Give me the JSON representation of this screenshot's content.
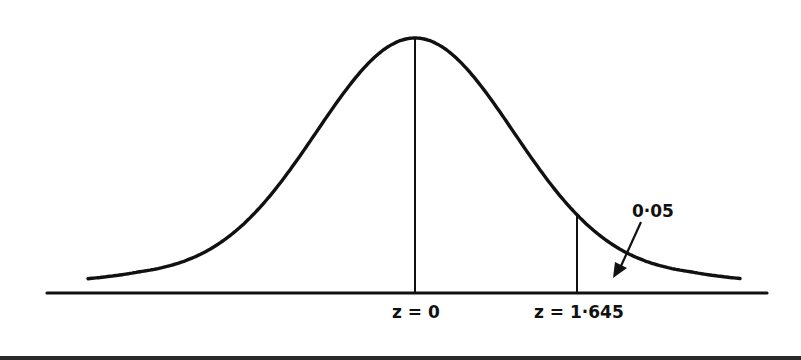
{
  "chart_data": {
    "type": "line",
    "title": "",
    "xlabel": "",
    "ylabel": "",
    "distribution": "standard normal",
    "mean": 0,
    "std": 1,
    "x_range": [
      -3.35,
      3.3
    ],
    "markers": [
      {
        "z": 0,
        "label": "z = 0",
        "type": "vertical-line-to-curve"
      },
      {
        "z": 1.645,
        "label": "z = 1·645",
        "type": "vertical-line-to-curve"
      }
    ],
    "annotations": [
      {
        "text": "0·05",
        "meaning": "shaded upper tail area beyond z = 1.645",
        "arrow": true
      }
    ],
    "grid": false,
    "legend": null
  },
  "labels": {
    "z0": "z = 0",
    "z1645": "z = 1·645",
    "tail_area": "0·05"
  },
  "geometry": {
    "center_x": 415,
    "sigma_px": 98.5,
    "curve_base_y": 276.5,
    "curve_height_px": 238.5,
    "axis_y": 293,
    "axis_x1": 47,
    "axis_x2": 767,
    "curve_x1": 88,
    "curve_x2": 740
  },
  "colors": {
    "ink": "#111111",
    "background": "#ffffff"
  }
}
